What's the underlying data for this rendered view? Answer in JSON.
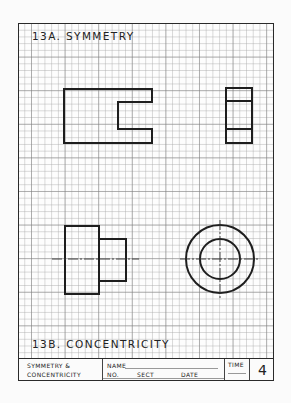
{
  "worksheet": {
    "section_a_title": "13A.  SYMMETRY",
    "section_b_title": "13B.  CONCENTRICITY",
    "title_block": {
      "title_line1": "SYMMETRY  &",
      "title_line2": "CONCENTRICITY",
      "name_label": "NAME",
      "no_label": "NO.",
      "sect_label": "SECT",
      "date_label": "DATE",
      "time_label": "TIME",
      "sheet_number": "4"
    },
    "grid": {
      "minor_spacing_px": 6.72,
      "major_every": 5
    },
    "drawings": [
      {
        "id": "symmetry-front-view",
        "shape": "c-channel"
      },
      {
        "id": "symmetry-side-view",
        "shape": "rectangle-with-two-lines"
      },
      {
        "id": "concentricity-front-view",
        "shape": "stepped-shaft-with-centerline"
      },
      {
        "id": "concentricity-end-view",
        "shape": "concentric-circles-with-centerlines"
      }
    ],
    "colors": {
      "line": "#1e1e1e",
      "grid_minor": "#c8c8c8",
      "grid_major": "#9a9a9a",
      "paper": "#fdfdfd"
    }
  }
}
